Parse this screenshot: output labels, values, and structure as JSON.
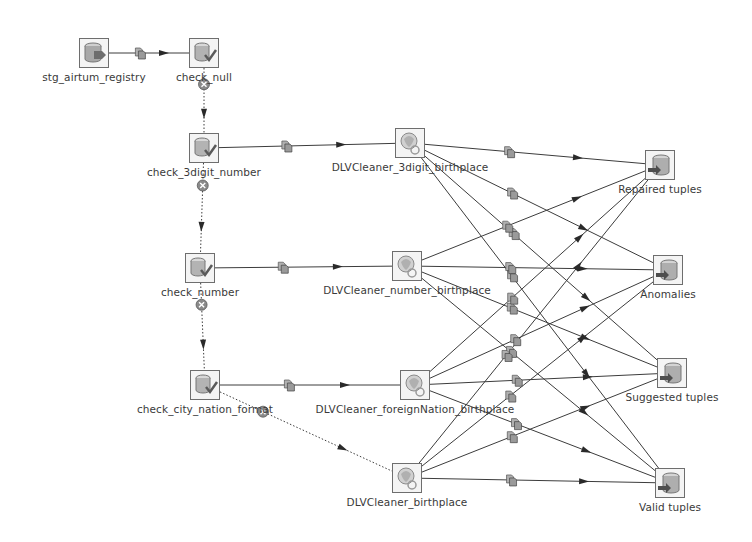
{
  "diagram": {
    "type": "etl-data-flow",
    "nodes": [
      {
        "id": "stg_airtum_registry",
        "label": "stg_airtum_registry",
        "kind": "source-table",
        "x": 94,
        "y": 53
      },
      {
        "id": "check_null",
        "label": "check_null",
        "kind": "filter",
        "x": 204,
        "y": 53
      },
      {
        "id": "check_3digit_number",
        "label": "check_3digit_number",
        "kind": "filter",
        "x": 204,
        "y": 148
      },
      {
        "id": "check_number",
        "label": "check_number",
        "kind": "filter",
        "x": 200,
        "y": 268
      },
      {
        "id": "check_city_nation_format",
        "label": "check_city_nation_format",
        "kind": "filter",
        "x": 205,
        "y": 385
      },
      {
        "id": "dlv_3digit",
        "label": "DLVCleaner_3digit_birthplace",
        "kind": "cleaner",
        "x": 410,
        "y": 143
      },
      {
        "id": "dlv_number",
        "label": "DLVCleaner_number_birthplace",
        "kind": "cleaner",
        "x": 407,
        "y": 266
      },
      {
        "id": "dlv_foreign",
        "label": "DLVCleaner_foreignNation_birthplace",
        "kind": "cleaner",
        "x": 415,
        "y": 385
      },
      {
        "id": "dlv_birthplace",
        "label": "DLVCleaner_birthplace",
        "kind": "cleaner",
        "x": 407,
        "y": 478
      },
      {
        "id": "repaired",
        "label": "Repaired tuples",
        "kind": "output-table",
        "x": 660,
        "y": 165
      },
      {
        "id": "anomalies",
        "label": "Anomalies",
        "kind": "output-table",
        "x": 668,
        "y": 270
      },
      {
        "id": "suggested",
        "label": "Suggested tuples",
        "kind": "output-table",
        "x": 672,
        "y": 373
      },
      {
        "id": "valid",
        "label": "Valid tuples",
        "kind": "output-table",
        "x": 670,
        "y": 483
      }
    ],
    "edges": [
      {
        "from": "stg_airtum_registry",
        "to": "check_null",
        "style": "solid"
      },
      {
        "from": "check_null",
        "to": "check_3digit_number",
        "style": "dotted-reject"
      },
      {
        "from": "check_3digit_number",
        "to": "check_number",
        "style": "dotted-reject"
      },
      {
        "from": "check_number",
        "to": "check_city_nation_format",
        "style": "dotted-reject"
      },
      {
        "from": "check_city_nation_format",
        "to": "dlv_birthplace",
        "style": "dotted-reject"
      },
      {
        "from": "check_3digit_number",
        "to": "dlv_3digit",
        "style": "solid"
      },
      {
        "from": "check_number",
        "to": "dlv_number",
        "style": "solid"
      },
      {
        "from": "check_city_nation_format",
        "to": "dlv_foreign",
        "style": "solid"
      },
      {
        "from": "dlv_3digit",
        "to": "repaired",
        "style": "solid"
      },
      {
        "from": "dlv_3digit",
        "to": "anomalies",
        "style": "solid"
      },
      {
        "from": "dlv_3digit",
        "to": "suggested",
        "style": "solid"
      },
      {
        "from": "dlv_3digit",
        "to": "valid",
        "style": "solid"
      },
      {
        "from": "dlv_number",
        "to": "repaired",
        "style": "solid"
      },
      {
        "from": "dlv_number",
        "to": "anomalies",
        "style": "solid"
      },
      {
        "from": "dlv_number",
        "to": "suggested",
        "style": "solid"
      },
      {
        "from": "dlv_number",
        "to": "valid",
        "style": "solid"
      },
      {
        "from": "dlv_foreign",
        "to": "repaired",
        "style": "solid"
      },
      {
        "from": "dlv_foreign",
        "to": "anomalies",
        "style": "solid"
      },
      {
        "from": "dlv_foreign",
        "to": "suggested",
        "style": "solid"
      },
      {
        "from": "dlv_foreign",
        "to": "valid",
        "style": "solid"
      },
      {
        "from": "dlv_birthplace",
        "to": "repaired",
        "style": "solid"
      },
      {
        "from": "dlv_birthplace",
        "to": "anomalies",
        "style": "solid"
      },
      {
        "from": "dlv_birthplace",
        "to": "suggested",
        "style": "solid"
      },
      {
        "from": "dlv_birthplace",
        "to": "valid",
        "style": "solid"
      }
    ],
    "colors": {
      "edge": "#3c3c3c",
      "node_border": "#6e6e6e",
      "label": "#3a3a3a",
      "background": "#ffffff"
    }
  }
}
